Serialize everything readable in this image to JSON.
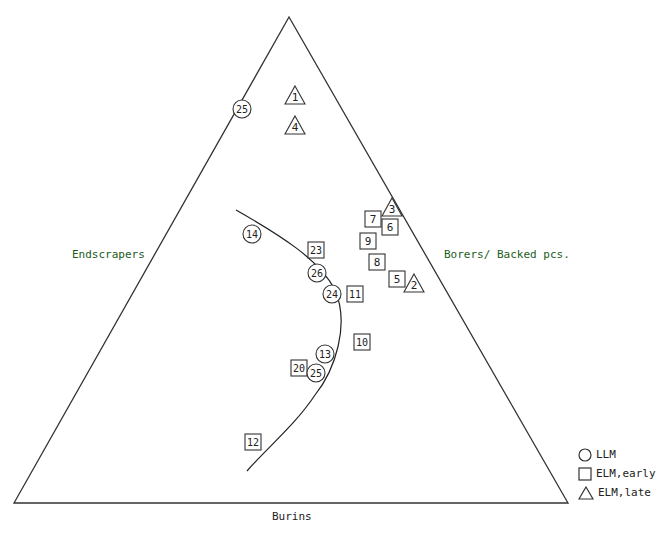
{
  "chart_data": {
    "type": "ternary-scatter",
    "title": "",
    "axes": {
      "left": "Endscrapers",
      "right": "Borers/ Backed pcs.",
      "bottom": "Burins"
    },
    "legend": [
      {
        "shape": "circle",
        "label": "LLM"
      },
      {
        "shape": "square",
        "label": "ELM,early"
      },
      {
        "shape": "triangle",
        "label": "ELM,late"
      }
    ],
    "points": [
      {
        "id": "25",
        "shape": "circle",
        "x": 242,
        "y": 109
      },
      {
        "id": "1",
        "shape": "triangle",
        "x": 295,
        "y": 96
      },
      {
        "id": "4",
        "shape": "triangle",
        "x": 295,
        "y": 126
      },
      {
        "id": "3",
        "shape": "triangle",
        "x": 392,
        "y": 208
      },
      {
        "id": "7",
        "shape": "square",
        "x": 373,
        "y": 219
      },
      {
        "id": "6",
        "shape": "square",
        "x": 390,
        "y": 227
      },
      {
        "id": "9",
        "shape": "square",
        "x": 368,
        "y": 241
      },
      {
        "id": "8",
        "shape": "square",
        "x": 377,
        "y": 262
      },
      {
        "id": "5",
        "shape": "square",
        "x": 397,
        "y": 279
      },
      {
        "id": "2",
        "shape": "triangle",
        "x": 414,
        "y": 284
      },
      {
        "id": "14",
        "shape": "circle",
        "x": 252,
        "y": 234
      },
      {
        "id": "23",
        "shape": "square",
        "x": 316,
        "y": 250
      },
      {
        "id": "26",
        "shape": "circle",
        "x": 317,
        "y": 273
      },
      {
        "id": "24",
        "shape": "circle",
        "x": 332,
        "y": 294
      },
      {
        "id": "11",
        "shape": "square",
        "x": 355,
        "y": 294
      },
      {
        "id": "10",
        "shape": "square",
        "x": 362,
        "y": 342
      },
      {
        "id": "13",
        "shape": "circle",
        "x": 325,
        "y": 354
      },
      {
        "id": "20",
        "shape": "square",
        "x": 299,
        "y": 368
      },
      {
        "id": "25",
        "shape": "circle",
        "x": 316,
        "y": 373
      },
      {
        "id": "12",
        "shape": "square",
        "x": 253,
        "y": 442
      }
    ],
    "trend_curve": "M236,210 C280,235 320,260 335,290 C350,325 335,370 315,395 C295,425 270,445 247,471",
    "triangle_vertices": {
      "apex": [
        289,
        17
      ],
      "left": [
        14,
        503
      ],
      "right": [
        568,
        503
      ]
    },
    "grid": false,
    "legend_position": "bottom-right"
  }
}
